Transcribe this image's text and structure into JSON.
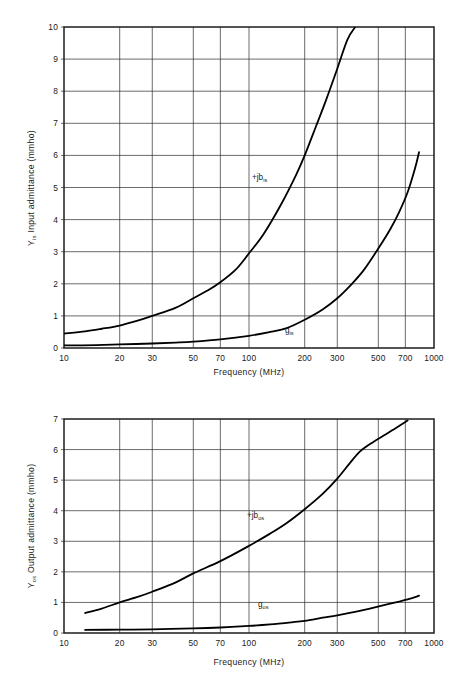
{
  "page": {
    "background_color": "#ffffff",
    "ink_color": "#1a1a1a"
  },
  "figures": [
    {
      "id": "input-admittance",
      "y_axis_title_main": "Y",
      "y_axis_title_sub": "is",
      "y_axis_title_rest": " Input admittance  (mmho)",
      "x_axis_title": "Frequency    (MHz)",
      "x_tick_labels": [
        "10",
        "20",
        "30",
        "50",
        "70",
        "100",
        "200",
        "300",
        "500",
        "700",
        "1000"
      ],
      "y_tick_labels": [
        "0",
        "1",
        "2",
        "3",
        "4",
        "5",
        "6",
        "7",
        "8",
        "9",
        "10"
      ],
      "curve_labels": [
        {
          "name": "susceptance-label",
          "main": "+jb",
          "sub": "is"
        },
        {
          "name": "conductance-label",
          "main": "g",
          "sub": "is"
        }
      ]
    },
    {
      "id": "output-admittance",
      "y_axis_title_main": "Y",
      "y_axis_title_sub": "os",
      "y_axis_title_rest": " Output admittance  (mmho)",
      "x_axis_title": "Frequency    (MHz)",
      "x_tick_labels": [
        "10",
        "20",
        "30",
        "50",
        "70",
        "100",
        "200",
        "300",
        "500",
        "700",
        "1000"
      ],
      "y_tick_labels": [
        "0",
        "1",
        "2",
        "3",
        "4",
        "5",
        "6",
        "7"
      ],
      "curve_labels": [
        {
          "name": "susceptance-label",
          "main": "+jb",
          "sub": "os"
        },
        {
          "name": "conductance-label",
          "main": "g",
          "sub": "os"
        }
      ]
    }
  ],
  "chart_data": [
    {
      "type": "line",
      "id": "input-admittance",
      "title": "",
      "xlabel": "Frequency    (MHz)",
      "ylabel": "Y_is Input admittance  (mmho)",
      "xscale": "log",
      "yscale": "linear",
      "xlim": [
        10,
        1000
      ],
      "ylim": [
        0,
        10
      ],
      "grid": true,
      "legend": "inline-annotations",
      "xticks": [
        10,
        20,
        30,
        50,
        70,
        100,
        200,
        300,
        500,
        700,
        1000
      ],
      "yticks": [
        0,
        1,
        2,
        3,
        4,
        5,
        6,
        7,
        8,
        9,
        10
      ],
      "series": [
        {
          "name": "+jb_is",
          "x": [
            10,
            13,
            16,
            20,
            25,
            30,
            40,
            50,
            60,
            70,
            85,
            100,
            120,
            150,
            180,
            200,
            230,
            260,
            300,
            340,
            375
          ],
          "y": [
            0.45,
            0.52,
            0.6,
            0.7,
            0.85,
            1.0,
            1.25,
            1.55,
            1.8,
            2.05,
            2.45,
            2.95,
            3.55,
            4.5,
            5.4,
            6.0,
            6.9,
            7.7,
            8.7,
            9.6,
            10.0
          ]
        },
        {
          "name": "g_is",
          "x": [
            10,
            15,
            20,
            30,
            40,
            50,
            70,
            100,
            130,
            160,
            200,
            250,
            300,
            360,
            420,
            500,
            580,
            650,
            720,
            790,
            830
          ],
          "y": [
            0.08,
            0.09,
            0.11,
            0.14,
            0.17,
            0.2,
            0.27,
            0.38,
            0.5,
            0.62,
            0.88,
            1.2,
            1.55,
            2.0,
            2.45,
            3.1,
            3.7,
            4.25,
            4.85,
            5.6,
            6.1
          ]
        }
      ]
    },
    {
      "type": "line",
      "id": "output-admittance",
      "title": "",
      "xlabel": "Frequency    (MHz)",
      "ylabel": "Y_os Output admittance  (mmho)",
      "xscale": "log",
      "yscale": "linear",
      "xlim": [
        10,
        1000
      ],
      "ylim": [
        0,
        7
      ],
      "grid": true,
      "legend": "inline-annotations",
      "xticks": [
        10,
        20,
        30,
        50,
        70,
        100,
        200,
        300,
        500,
        700,
        1000
      ],
      "yticks": [
        0,
        1,
        2,
        3,
        4,
        5,
        6,
        7
      ],
      "series": [
        {
          "name": "+jb_os",
          "x": [
            13,
            16,
            20,
            25,
            30,
            40,
            50,
            70,
            100,
            130,
            160,
            200,
            250,
            300,
            350,
            400,
            470,
            550,
            620,
            720
          ],
          "y": [
            0.65,
            0.8,
            1.0,
            1.18,
            1.35,
            1.65,
            1.95,
            2.35,
            2.85,
            3.25,
            3.6,
            4.05,
            4.55,
            5.05,
            5.55,
            5.95,
            6.25,
            6.5,
            6.7,
            6.95
          ]
        },
        {
          "name": "g_os",
          "x": [
            13,
            20,
            30,
            50,
            70,
            100,
            130,
            170,
            200,
            250,
            300,
            380,
            450,
            550,
            650,
            720,
            790,
            830
          ],
          "y": [
            0.1,
            0.11,
            0.12,
            0.15,
            0.18,
            0.23,
            0.28,
            0.35,
            0.4,
            0.5,
            0.58,
            0.7,
            0.8,
            0.93,
            1.03,
            1.1,
            1.17,
            1.22
          ]
        }
      ]
    }
  ]
}
